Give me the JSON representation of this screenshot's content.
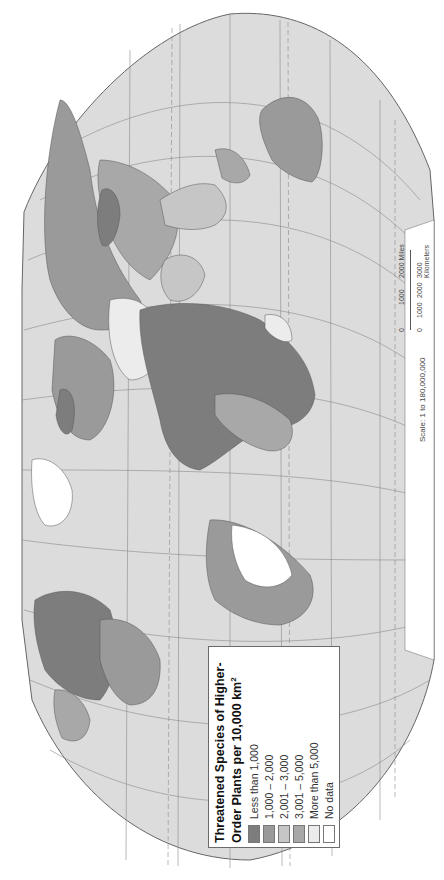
{
  "map": {
    "title_line1": "Threatened Species of Higher-",
    "title_line2": "Order Plants per 10,000 km",
    "title_superscript": "2",
    "orientation": "rotated 90° counter-clockwise",
    "ocean_color": "#dcdcdc",
    "graticule_color": "#8a8a8a",
    "legend": [
      {
        "label": "Less than 1,000",
        "color": "#7d7d7d"
      },
      {
        "label": "1,000 – 2,000",
        "color": "#9a9a9a"
      },
      {
        "label": "2,001 – 3,000",
        "color": "#c6c6c6"
      },
      {
        "label": "3,001 – 5,000",
        "color": "#a8a8a8"
      },
      {
        "label": "More than 5,000",
        "color": "#ececec"
      },
      {
        "label": "No data",
        "color": "#ffffff"
      }
    ],
    "scale": {
      "text": "Scale:  1 to 180,000,000",
      "miles_ticks": [
        "0",
        "1000",
        "2000 Miles"
      ],
      "km_ticks": [
        "0",
        "1000",
        "2000",
        "3000 Kilometers"
      ]
    }
  }
}
